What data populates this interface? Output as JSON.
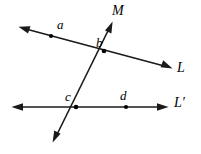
{
  "figure": {
    "background_color": "#ffffff",
    "stroke_color": "#1a1a1a",
    "width": 201,
    "height": 154
  },
  "labels": {
    "line_m": "M",
    "line_l": "L",
    "line_l_prime": "L′",
    "point_a": "a",
    "point_b": "b",
    "point_c": "c",
    "point_d": "d"
  },
  "geometry": {
    "lines": [
      {
        "name": "L",
        "label": "L",
        "from": [
          19,
          27
        ],
        "to": [
          172,
          68
        ],
        "arrows": "both"
      },
      {
        "name": "L-prime",
        "label": "L′",
        "from": [
          12,
          107
        ],
        "to": [
          168,
          107
        ],
        "arrows": "both"
      },
      {
        "name": "M",
        "label": "M",
        "from": [
          112,
          22
        ],
        "to": [
          53,
          142
        ],
        "arrows": "both"
      }
    ],
    "points": [
      {
        "name": "a",
        "label": "a",
        "x": 51,
        "y": 36,
        "on": [
          "L"
        ],
        "marked": true
      },
      {
        "name": "b",
        "label": "b",
        "x": 104,
        "y": 51,
        "on": [
          "L",
          "M"
        ],
        "marked": true
      },
      {
        "name": "c",
        "label": "c",
        "x": 76,
        "y": 107,
        "on": [
          "L-prime",
          "M"
        ],
        "marked": true
      },
      {
        "name": "d",
        "label": "d",
        "x": 126,
        "y": 107,
        "on": [
          "L-prime"
        ],
        "marked": true
      }
    ]
  }
}
